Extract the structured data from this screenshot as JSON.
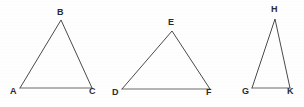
{
  "figure": {
    "background_color": "#fefefe",
    "line_color": "#4a4a4a",
    "label_color": "#2b2b2b",
    "width": 304,
    "height": 107,
    "triangles": [
      {
        "id": "triangle-abc",
        "name": "Triangle ABC",
        "vertices": [
          {
            "label": "A",
            "x": 20,
            "y": 88,
            "label_x": 10,
            "label_y": 87
          },
          {
            "label": "B",
            "x": 61,
            "y": 20,
            "label_x": 57,
            "label_y": 8
          },
          {
            "label": "C",
            "x": 92,
            "y": 88,
            "label_x": 89,
            "label_y": 87
          }
        ],
        "path": "M 20 88 L 61 20 L 92 88",
        "base_path": "M 20 88 L 92 88"
      },
      {
        "id": "triangle-def",
        "name": "Triangle DEF",
        "vertices": [
          {
            "label": "D",
            "x": 122,
            "y": 89,
            "label_x": 112,
            "label_y": 88
          },
          {
            "label": "E",
            "x": 172,
            "y": 31,
            "label_x": 168,
            "label_y": 18
          },
          {
            "label": "F",
            "x": 210,
            "y": 89,
            "label_x": 206,
            "label_y": 88
          }
        ],
        "path": "M 122 89 L 172 31 L 210 89",
        "base_path": "M 122 89 L 210 89"
      },
      {
        "id": "triangle-ghk",
        "name": "Triangle GHK",
        "vertices": [
          {
            "label": "G",
            "x": 252,
            "y": 88,
            "label_x": 242,
            "label_y": 87
          },
          {
            "label": "H",
            "x": 275,
            "y": 19,
            "label_x": 271,
            "label_y": 5
          },
          {
            "label": "K",
            "x": 290,
            "y": 88,
            "label_x": 287,
            "label_y": 87
          }
        ],
        "path": "M 252 88 L 275 19 L 290 88",
        "base_path": "M 252 88 L 290 88"
      }
    ]
  }
}
